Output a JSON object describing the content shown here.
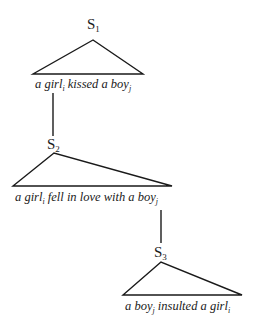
{
  "diagram": {
    "type": "tree-of-sentences",
    "line_color": "#1a1a1a",
    "nodes": [
      {
        "id": "S1",
        "label": "S",
        "subscript": "1",
        "sentence": [
          {
            "text": "a girl",
            "sub": "i"
          },
          {
            "text": " kissed a boy",
            "sub": "j"
          }
        ]
      },
      {
        "id": "S2",
        "label": "S",
        "subscript": "2",
        "sentence": [
          {
            "text": "a girl",
            "sub": "i"
          },
          {
            "text": " fell in love with a boy",
            "sub": "j"
          }
        ]
      },
      {
        "id": "S3",
        "label": "S",
        "subscript": "3",
        "sentence": [
          {
            "text": "a boy",
            "sub": "j"
          },
          {
            "text": " insulted a girl",
            "sub": "i"
          }
        ]
      }
    ],
    "edges": [
      {
        "from": "S1",
        "to": "S2"
      },
      {
        "from": "S2",
        "to": "S3"
      }
    ]
  }
}
